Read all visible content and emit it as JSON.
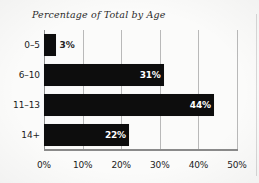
{
  "chart_data": {
    "type": "bar",
    "orientation": "horizontal",
    "title": "Percentage of Total by Age",
    "xlabel": "",
    "ylabel": "",
    "categories": [
      "0–5",
      "6–10",
      "11–13",
      "14+"
    ],
    "values": [
      3,
      31,
      44,
      22
    ],
    "value_labels": [
      "3%",
      "31%",
      "44%",
      "22%"
    ],
    "value_label_placement": [
      "outside",
      "inside",
      "inside",
      "inside"
    ],
    "xlim": [
      0,
      50
    ],
    "xticks": [
      0,
      10,
      20,
      30,
      40,
      50
    ],
    "xtick_labels": [
      "0%",
      "10%",
      "20%",
      "30%",
      "40%",
      "50%"
    ],
    "grid": "vertical",
    "legend": "none",
    "bar_color": "#0d0d0d",
    "inside_label_color": "#ffffff",
    "outside_label_color": "#232323",
    "gridline_color": "#b9b9b9",
    "axis_color": "#8a8a8a",
    "background_color": "#fbfbfa"
  }
}
